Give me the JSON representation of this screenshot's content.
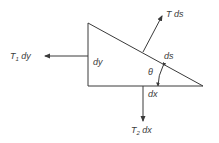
{
  "diagram": {
    "type": "free-body-triangle",
    "colors": {
      "stroke": "#3a3a3a",
      "background": "#ffffff"
    },
    "labels": {
      "left_force": {
        "main": "T",
        "sub": "1",
        "rest": " dy"
      },
      "normal_force": {
        "text": "T ds"
      },
      "bottom_force": {
        "main": "T",
        "sub": "2",
        "rest": " dx"
      },
      "left_side": {
        "text": "dy"
      },
      "hypotenuse": {
        "text": "ds"
      },
      "base": {
        "text": "dx"
      },
      "angle": {
        "text": "θ"
      }
    }
  }
}
